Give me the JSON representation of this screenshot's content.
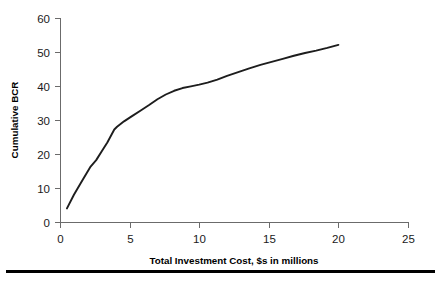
{
  "chart_data": {
    "type": "line",
    "title": "",
    "xlabel": "Total Investment Cost, $s in millions",
    "ylabel": "Cumulative BCR",
    "xlim": [
      0,
      25
    ],
    "ylim": [
      0,
      60
    ],
    "xticks": [
      0,
      5,
      10,
      15,
      20,
      25
    ],
    "yticks": [
      0,
      10,
      20,
      30,
      40,
      50,
      60
    ],
    "xtick_labels": [
      "0",
      "5",
      "10",
      "15",
      "20",
      "25"
    ],
    "ytick_labels": [
      "0",
      "10",
      "20",
      "30",
      "40",
      "50",
      "60"
    ],
    "grid": false,
    "legend": false,
    "legend_position": "none",
    "series": [
      {
        "name": "Cumulative BCR",
        "color": "#1d1d1d",
        "x": [
          0.5,
          1.0,
          1.6,
          2.2,
          2.6,
          3.0,
          3.4,
          3.9,
          4.1,
          4.6,
          5.2,
          5.8,
          6.4,
          7.0,
          7.6,
          8.2,
          8.8,
          9.4,
          10.0,
          10.6,
          11.3,
          12.0,
          12.8,
          13.6,
          14.4,
          15.2,
          16.0,
          16.8,
          17.6,
          18.4,
          19.2,
          20.0
        ],
        "y": [
          4.0,
          8.0,
          12.2,
          16.3,
          18.2,
          20.8,
          23.4,
          27.2,
          28.0,
          29.6,
          31.2,
          32.8,
          34.4,
          36.1,
          37.5,
          38.6,
          39.4,
          39.9,
          40.4,
          41.0,
          41.9,
          43.0,
          44.1,
          45.2,
          46.2,
          47.1,
          48.0,
          48.9,
          49.7,
          50.4,
          51.2,
          52.1
        ]
      }
    ]
  },
  "axes": {
    "y_axis_title": "Cumulative BCR",
    "x_axis_title": "Total Investment Cost, $s in millions"
  }
}
